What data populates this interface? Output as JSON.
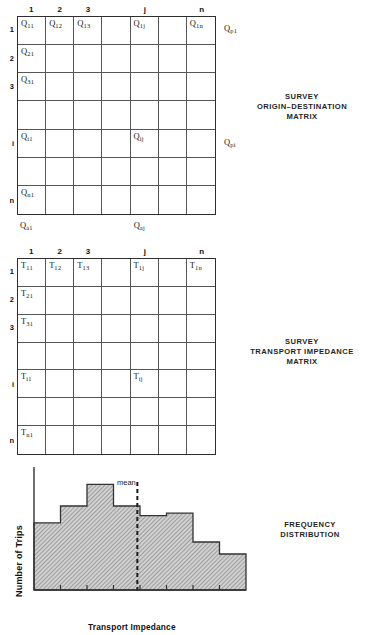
{
  "figure": {
    "background": "#ffffff",
    "ink": "#1a1a1a"
  },
  "matrix_od": {
    "caption_lines": [
      "SURVEY",
      "ORIGIN–DESTINATION",
      "MATRIX"
    ],
    "column_headers": [
      "1",
      "2",
      "3",
      "",
      "j",
      "",
      "n"
    ],
    "row_headers": [
      "1",
      "2",
      "3",
      "",
      "i",
      "",
      "n"
    ],
    "cells": [
      {
        "row": 0,
        "col": 0,
        "sym": "Q",
        "sub": "11"
      },
      {
        "row": 0,
        "col": 1,
        "sym": "Q",
        "sub": "12"
      },
      {
        "row": 0,
        "col": 2,
        "sym": "Q",
        "sub": "13"
      },
      {
        "row": 0,
        "col": 4,
        "sym": "Q",
        "sub": "1j"
      },
      {
        "row": 0,
        "col": 6,
        "sym": "Q",
        "sub": "1n"
      },
      {
        "row": 1,
        "col": 0,
        "sym": "Q",
        "sub": "21"
      },
      {
        "row": 2,
        "col": 0,
        "sym": "Q",
        "sub": "31"
      },
      {
        "row": 4,
        "col": 0,
        "sym": "Q",
        "sub": "i1"
      },
      {
        "row": 4,
        "col": 4,
        "sym": "Q",
        "sub": "ij"
      },
      {
        "row": 6,
        "col": 0,
        "sym": "Q",
        "sub": "n1"
      }
    ],
    "row_sums": [
      {
        "row": 0,
        "sym": "Q",
        "sub": "p1"
      },
      {
        "row": 4,
        "sym": "Q",
        "sub": "pi"
      }
    ],
    "col_sums": [
      {
        "col": 0,
        "sym": "Q",
        "sub": "a1"
      },
      {
        "col": 4,
        "sym": "Q",
        "sub": "aj"
      }
    ]
  },
  "matrix_impedance": {
    "caption_lines": [
      "SURVEY",
      "TRANSPORT IMPEDANCE",
      "MATRIX"
    ],
    "column_headers": [
      "1",
      "2",
      "3",
      "",
      "j",
      "",
      "n"
    ],
    "row_headers": [
      "1",
      "2",
      "3",
      "",
      "i",
      "",
      "n"
    ],
    "cells": [
      {
        "row": 0,
        "col": 0,
        "sym": "T",
        "sub": "11"
      },
      {
        "row": 0,
        "col": 1,
        "sym": "T",
        "sub": "12"
      },
      {
        "row": 0,
        "col": 2,
        "sym": "T",
        "sub": "13"
      },
      {
        "row": 0,
        "col": 4,
        "sym": "T",
        "sub": "1j"
      },
      {
        "row": 0,
        "col": 6,
        "sym": "T",
        "sub": "1n"
      },
      {
        "row": 1,
        "col": 0,
        "sym": "T",
        "sub": "21"
      },
      {
        "row": 2,
        "col": 0,
        "sym": "T",
        "sub": "31"
      },
      {
        "row": 4,
        "col": 0,
        "sym": "T",
        "sub": "i1"
      },
      {
        "row": 4,
        "col": 4,
        "sym": "T",
        "sub": "ij"
      },
      {
        "row": 6,
        "col": 0,
        "sym": "T",
        "sub": "n1"
      }
    ],
    "row_sums": [],
    "col_sums": []
  },
  "histogram": {
    "caption_lines": [
      "FREQUENCY",
      "DISTRIBUTION"
    ],
    "mean_label": "mean"
  },
  "chart_data": {
    "type": "bar",
    "xlabel": "Transport Impedance",
    "ylabel": "Number of Trips",
    "categories": [
      "1",
      "2",
      "3",
      "4",
      "5",
      "6",
      "7",
      "8"
    ],
    "values": [
      56,
      70,
      88,
      70,
      62,
      64,
      40,
      30
    ],
    "ylim": [
      0,
      100
    ],
    "xlim": [
      0,
      8
    ],
    "grid": false,
    "legend": false,
    "annotations": [
      {
        "label": "mean",
        "type": "vline",
        "x": 3.9
      }
    ],
    "tick_count_x": 8,
    "bar_fill": "#b3b3b3",
    "bar_edge": "#333333"
  }
}
